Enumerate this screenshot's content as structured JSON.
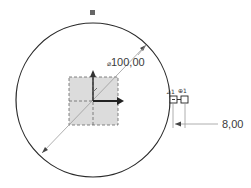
{
  "sketch": {
    "circle": {
      "cx": 93,
      "cy": 100,
      "r": 77,
      "stroke": "#2a2a2a"
    },
    "diameter_dimension": {
      "prefix": "⌀",
      "value": "100,00"
    },
    "offset_dimension": {
      "value": "8,00"
    },
    "constraint_symbols": [
      "⊿1",
      "⊕1"
    ],
    "origin": {
      "x_axis_color": "#222222",
      "y_axis_color": "#333333"
    },
    "colors": {
      "grid_fill": "#d9d9d9",
      "grid_stroke": "#666666",
      "dim_line": "#9a9a9a"
    }
  }
}
